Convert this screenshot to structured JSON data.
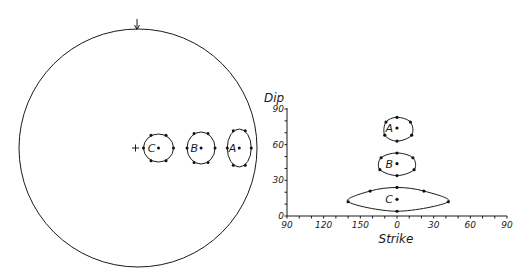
{
  "chart_data": [
    {
      "type": "scatter",
      "name": "stereonet-projection",
      "title": "",
      "north_marker": "arrow-down-icon",
      "center_marker": "plus",
      "groups": [
        {
          "label": "C",
          "center": {
            "strike": 180,
            "dip": 14
          },
          "points": 6
        },
        {
          "label": "B",
          "center": {
            "strike": 180,
            "dip": 44
          },
          "points": 6
        },
        {
          "label": "A",
          "center": {
            "strike": 180,
            "dip": 74
          },
          "points": 6
        }
      ]
    },
    {
      "type": "scatter",
      "name": "strike-dip-plot",
      "title": "",
      "xlabel": "Strike",
      "ylabel": "Dip",
      "xticks": [
        "90",
        "120",
        "150",
        "0",
        "30",
        "60",
        "90"
      ],
      "xtick_values": [
        90,
        120,
        150,
        180,
        210,
        240,
        270
      ],
      "yticks": [
        "0",
        "30",
        "60",
        "90"
      ],
      "ytick_values": [
        0,
        30,
        60,
        90
      ],
      "xlim": [
        90,
        270
      ],
      "ylim": [
        0,
        90
      ],
      "grid": false,
      "series": [
        {
          "name": "A",
          "center": [
            180,
            74
          ],
          "outline": [
            [
              180,
              83
            ],
            [
              191,
              79
            ],
            [
              192,
              68
            ],
            [
              180,
              63
            ],
            [
              170,
              68
            ],
            [
              171,
              79
            ]
          ]
        },
        {
          "name": "B",
          "center": [
            180,
            44
          ],
          "outline": [
            [
              180,
              53
            ],
            [
              193,
              49
            ],
            [
              194,
              39
            ],
            [
              180,
              34
            ],
            [
              166,
              39
            ],
            [
              167,
              49
            ]
          ]
        },
        {
          "name": "C",
          "center": [
            180,
            14
          ],
          "outline": [
            [
              180,
              24
            ],
            [
              202,
              21
            ],
            [
              222,
              12
            ],
            [
              180,
              4
            ],
            [
              140,
              12
            ],
            [
              158,
              21
            ]
          ]
        }
      ]
    }
  ]
}
